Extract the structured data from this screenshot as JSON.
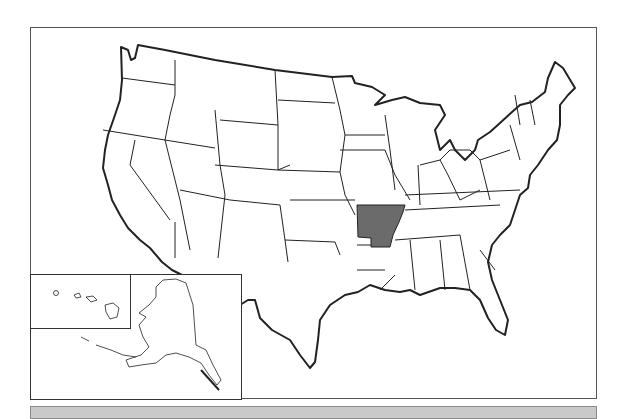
{
  "map": {
    "title": "",
    "region": "United States",
    "highlighted_state": "Arkansas",
    "highlight_color": "#6b6b6b",
    "state_fill": "#ffffff",
    "border_color": "#222222",
    "insets": [
      "Alaska",
      "Hawaii"
    ]
  },
  "bottom_bar": {
    "color": "#c9c9c9"
  }
}
